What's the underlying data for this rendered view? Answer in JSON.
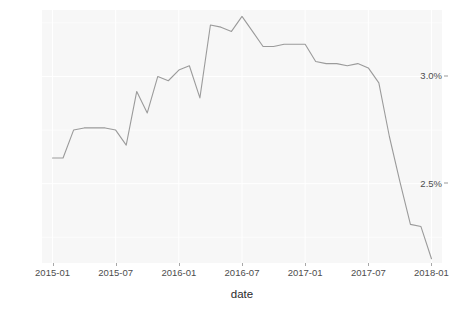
{
  "chart_data": {
    "type": "line",
    "title": "",
    "xlabel": "date",
    "ylabel": "",
    "grid": true,
    "legend": null,
    "line_color": "#9b9b9b",
    "panel_color": "#f7f7f7",
    "grid_color": "#ffffff",
    "x_tick_labels": [
      "2015-01",
      "2015-07",
      "2016-01",
      "2016-07",
      "2017-01",
      "2017-07",
      "2018-01"
    ],
    "x_tick_values": [
      "2015-01",
      "2015-07",
      "2016-01",
      "2016-07",
      "2017-01",
      "2017-07",
      "2018-01"
    ],
    "y_tick_labels": [
      "2.5%",
      "3.0%"
    ],
    "y_tick_values": [
      2.5,
      3.0
    ],
    "xlim": [
      "2014-12",
      "2018-02"
    ],
    "ylim": [
      2.13,
      3.31
    ],
    "x": [
      "2015-01",
      "2015-02",
      "2015-03",
      "2015-04",
      "2015-05",
      "2015-06",
      "2015-07",
      "2015-08",
      "2015-09",
      "2015-10",
      "2015-11",
      "2015-12",
      "2016-01",
      "2016-02",
      "2016-03",
      "2016-04",
      "2016-05",
      "2016-06",
      "2016-07",
      "2016-08",
      "2016-09",
      "2016-10",
      "2016-11",
      "2016-12",
      "2017-01",
      "2017-02",
      "2017-03",
      "2017-04",
      "2017-05",
      "2017-06",
      "2017-07",
      "2017-08",
      "2017-09",
      "2017-10",
      "2017-11",
      "2017-12",
      "2018-01"
    ],
    "values": [
      2.62,
      2.62,
      2.75,
      2.76,
      2.76,
      2.76,
      2.75,
      2.68,
      2.93,
      2.83,
      3.0,
      2.98,
      3.03,
      3.05,
      2.9,
      3.24,
      3.23,
      3.21,
      3.28,
      3.21,
      3.14,
      3.14,
      3.15,
      3.15,
      3.15,
      3.07,
      3.06,
      3.06,
      3.05,
      3.06,
      3.04,
      2.97,
      2.72,
      2.51,
      2.31,
      2.3,
      2.15
    ],
    "series": [
      {
        "name": "rate",
        "values": [
          2.62,
          2.62,
          2.75,
          2.76,
          2.76,
          2.76,
          2.75,
          2.68,
          2.93,
          2.83,
          3.0,
          2.98,
          3.03,
          3.05,
          2.9,
          3.24,
          3.23,
          3.21,
          3.28,
          3.21,
          3.14,
          3.14,
          3.15,
          3.15,
          3.15,
          3.07,
          3.06,
          3.06,
          3.05,
          3.06,
          3.04,
          2.97,
          2.72,
          2.51,
          2.31,
          2.3,
          2.15
        ]
      }
    ]
  }
}
